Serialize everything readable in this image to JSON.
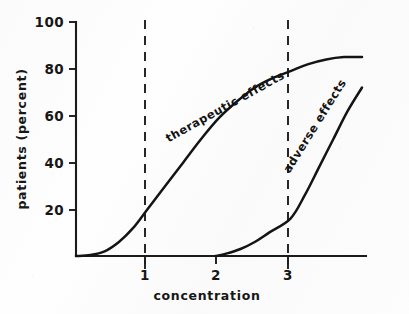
{
  "chart_data": {
    "type": "line",
    "title": "",
    "subtitle": "",
    "xlabel": "concentration",
    "ylabel": "patients (percent)",
    "xlim": [
      0,
      4
    ],
    "ylim": [
      0,
      100
    ],
    "grid": false,
    "legend_position": "inline-curve-labels",
    "x_ticks": [
      "1",
      "2",
      "3"
    ],
    "x_tick_values": [
      1,
      2,
      3
    ],
    "y_ticks": [
      "20",
      "40",
      "60",
      "80",
      "100"
    ],
    "y_tick_values": [
      20,
      40,
      60,
      80,
      100
    ],
    "annotations": [
      {
        "name": "reference-line-1",
        "type": "vertical-dashed-line",
        "x": 1
      },
      {
        "name": "reference-line-3",
        "type": "vertical-dashed-line",
        "x": 3
      }
    ],
    "series": [
      {
        "name": "therapeutic effects",
        "label": "therapeutic effects",
        "color": "#141414",
        "points": [
          {
            "x": 0.0,
            "y": 0
          },
          {
            "x": 0.2,
            "y": 0.4
          },
          {
            "x": 0.4,
            "y": 2
          },
          {
            "x": 0.6,
            "y": 6
          },
          {
            "x": 0.8,
            "y": 12
          },
          {
            "x": 1.0,
            "y": 20
          },
          {
            "x": 1.25,
            "y": 30
          },
          {
            "x": 1.5,
            "y": 40
          },
          {
            "x": 1.75,
            "y": 50
          },
          {
            "x": 2.0,
            "y": 59
          },
          {
            "x": 2.25,
            "y": 66
          },
          {
            "x": 2.5,
            "y": 72
          },
          {
            "x": 2.75,
            "y": 76
          },
          {
            "x": 3.0,
            "y": 79
          },
          {
            "x": 3.25,
            "y": 82
          },
          {
            "x": 3.5,
            "y": 84
          },
          {
            "x": 3.75,
            "y": 85
          },
          {
            "x": 4.0,
            "y": 85
          }
        ]
      },
      {
        "name": "adverse effects",
        "label": "adverse effects",
        "color": "#141414",
        "points": [
          {
            "x": 1.95,
            "y": 0
          },
          {
            "x": 2.1,
            "y": 1
          },
          {
            "x": 2.3,
            "y": 3
          },
          {
            "x": 2.5,
            "y": 6
          },
          {
            "x": 2.7,
            "y": 10
          },
          {
            "x": 3.0,
            "y": 16
          },
          {
            "x": 3.2,
            "y": 26
          },
          {
            "x": 3.4,
            "y": 38
          },
          {
            "x": 3.6,
            "y": 50
          },
          {
            "x": 3.8,
            "y": 62
          },
          {
            "x": 4.0,
            "y": 72
          },
          {
            "x": 4.2,
            "y": 82
          },
          {
            "x": 4.35,
            "y": 90
          },
          {
            "x": 4.5,
            "y": 95
          },
          {
            "x": 4.65,
            "y": 97
          },
          {
            "x": 4.8,
            "y": 98
          }
        ]
      }
    ]
  }
}
